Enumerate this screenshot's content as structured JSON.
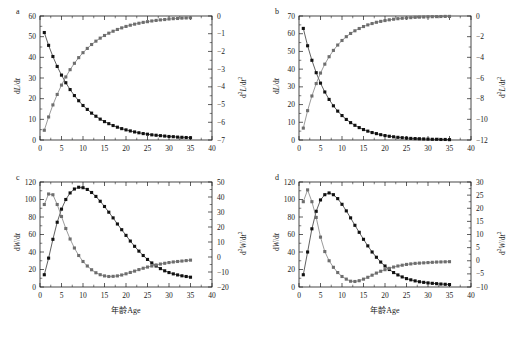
{
  "figure": {
    "width": 518,
    "height": 339,
    "background": "#ffffff",
    "panel_letters": [
      "a",
      "b",
      "c",
      "d"
    ]
  },
  "colors": {
    "series_first": "#111111",
    "series_second": "#6e6e6e",
    "axis": "#1a1a1a",
    "background": "#ffffff"
  },
  "labels": {
    "xlabel_cn": "年龄",
    "xlabel_en": "Age",
    "xlabel_full": "年龄Age",
    "dL_dt": "dL/dt",
    "d2L_dt2": "d²L/dt²",
    "dW_dt": "dW/dt",
    "d2W_dt2": "d²W/dt²"
  },
  "chart_data": [
    {
      "id": "panel-a",
      "panel": "a",
      "type": "line",
      "title": "",
      "xlabel": "",
      "ylabel": "dL/dt",
      "y2label": "d²L/dt²",
      "xlim": [
        0,
        40
      ],
      "ylim": [
        0,
        60
      ],
      "y2lim": [
        -7,
        0
      ],
      "xticks": [
        0,
        5,
        10,
        15,
        20,
        25,
        30,
        35,
        40
      ],
      "yticks": [
        0,
        10,
        20,
        30,
        40,
        50,
        60
      ],
      "y2ticks": [
        -7,
        -6,
        -5,
        -4,
        -3,
        -2,
        -1,
        0
      ],
      "grid": false,
      "legend": "none",
      "x": [
        1,
        2,
        3,
        4,
        5,
        6,
        7,
        8,
        9,
        10,
        11,
        12,
        13,
        14,
        15,
        16,
        17,
        18,
        19,
        20,
        21,
        22,
        23,
        24,
        25,
        26,
        27,
        28,
        29,
        30,
        31,
        32,
        33,
        34,
        35
      ],
      "series": [
        {
          "name": "dL/dt",
          "axis": "left",
          "marker": "square-filled",
          "color": "#111111",
          "values": [
            52.0,
            45.8,
            40.4,
            35.6,
            31.4,
            27.7,
            24.4,
            21.5,
            19.0,
            16.7,
            14.8,
            13.0,
            11.5,
            10.1,
            8.9,
            7.9,
            7.0,
            6.2,
            5.5,
            4.9,
            4.4,
            3.9,
            3.5,
            3.1,
            2.8,
            2.5,
            2.3,
            2.1,
            1.9,
            1.7,
            1.6,
            1.4,
            1.3,
            1.2,
            1.1
          ]
        },
        {
          "name": "d²L/dt²",
          "axis": "right",
          "marker": "square-filled",
          "color": "#6e6e6e",
          "values": [
            -6.45,
            -5.7,
            -5.02,
            -4.43,
            -3.9,
            -3.44,
            -3.03,
            -2.67,
            -2.35,
            -2.07,
            -1.83,
            -1.61,
            -1.42,
            -1.25,
            -1.1,
            -0.97,
            -0.86,
            -0.76,
            -0.67,
            -0.59,
            -0.52,
            -0.46,
            -0.41,
            -0.36,
            -0.32,
            -0.28,
            -0.25,
            -0.22,
            -0.2,
            -0.17,
            -0.15,
            -0.14,
            -0.12,
            -0.11,
            -0.1
          ]
        }
      ]
    },
    {
      "id": "panel-b",
      "panel": "b",
      "type": "line",
      "title": "",
      "xlabel": "",
      "ylabel": "dL/dt",
      "y2label": "d²L/dt²",
      "xlim": [
        0,
        40
      ],
      "ylim": [
        0,
        70
      ],
      "y2lim": [
        -12,
        0
      ],
      "xticks": [
        0,
        5,
        10,
        15,
        20,
        25,
        30,
        35,
        40
      ],
      "yticks": [
        0,
        10,
        20,
        30,
        40,
        50,
        60,
        70
      ],
      "y2ticks": [
        -12,
        -10,
        -8,
        -6,
        -4,
        -2,
        0
      ],
      "grid": false,
      "legend": "none",
      "x": [
        1,
        2,
        3,
        4,
        5,
        6,
        7,
        8,
        9,
        10,
        11,
        12,
        13,
        14,
        15,
        16,
        17,
        18,
        19,
        20,
        21,
        22,
        23,
        24,
        25,
        26,
        27,
        28,
        29,
        30,
        31,
        32,
        33,
        34,
        35
      ],
      "series": [
        {
          "name": "dL/dt",
          "axis": "left",
          "marker": "square-filled",
          "color": "#111111",
          "values": [
            63.0,
            53.2,
            45.0,
            38.0,
            32.1,
            27.1,
            22.9,
            19.3,
            16.3,
            13.8,
            11.6,
            9.8,
            8.3,
            7.0,
            5.9,
            5.0,
            4.2,
            3.6,
            3.0,
            2.5,
            2.1,
            1.8,
            1.5,
            1.3,
            1.1,
            0.9,
            0.8,
            0.7,
            0.6,
            0.5,
            0.4,
            0.4,
            0.3,
            0.3,
            0.2
          ]
        },
        {
          "name": "d²L/dt²",
          "axis": "right",
          "marker": "square-filled",
          "color": "#6e6e6e",
          "values": [
            -10.85,
            -9.16,
            -7.74,
            -6.54,
            -5.52,
            -4.66,
            -3.94,
            -3.33,
            -2.81,
            -2.37,
            -2.0,
            -1.69,
            -1.43,
            -1.21,
            -1.02,
            -0.86,
            -0.73,
            -0.61,
            -0.52,
            -0.44,
            -0.37,
            -0.31,
            -0.26,
            -0.22,
            -0.19,
            -0.16,
            -0.13,
            -0.11,
            -0.1,
            -0.08,
            -0.07,
            -0.06,
            -0.05,
            -0.04,
            -0.04
          ]
        }
      ]
    },
    {
      "id": "panel-c",
      "panel": "c",
      "type": "line",
      "title": "",
      "xlabel": "年龄Age",
      "ylabel": "dW/dt",
      "y2label": "d²W/dt²",
      "xlim": [
        0,
        40
      ],
      "ylim": [
        0,
        120
      ],
      "y2lim": [
        -20,
        50
      ],
      "xticks": [
        0,
        5,
        10,
        15,
        20,
        25,
        30,
        35,
        40
      ],
      "yticks": [
        0,
        20,
        40,
        60,
        80,
        100,
        120
      ],
      "y2ticks": [
        -20,
        -10,
        0,
        10,
        20,
        30,
        40,
        50
      ],
      "grid": false,
      "legend": "none",
      "x": [
        1,
        2,
        3,
        4,
        5,
        6,
        7,
        8,
        9,
        10,
        11,
        12,
        13,
        14,
        15,
        16,
        17,
        18,
        19,
        20,
        21,
        22,
        23,
        24,
        25,
        26,
        27,
        28,
        29,
        30,
        31,
        32,
        33,
        34,
        35
      ],
      "series": [
        {
          "name": "dW/dt",
          "axis": "left",
          "marker": "square-filled",
          "color": "#111111",
          "values": [
            14.0,
            33.0,
            54.5,
            74.0,
            89.0,
            100.0,
            107.5,
            112.0,
            114.0,
            113.5,
            111.5,
            108.0,
            103.5,
            98.0,
            92.0,
            85.5,
            79.0,
            72.0,
            65.5,
            59.0,
            52.5,
            46.5,
            41.0,
            36.0,
            31.5,
            27.5,
            24.0,
            21.0,
            18.5,
            16.5,
            15.0,
            13.8,
            12.8,
            12.0,
            11.2
          ]
        },
        {
          "name": "d²W/dt²",
          "axis": "right",
          "marker": "square-filled",
          "color": "#6e6e6e",
          "values": [
            35.0,
            42.0,
            41.5,
            35.0,
            27.0,
            19.0,
            12.0,
            6.0,
            1.0,
            -3.0,
            -6.0,
            -8.5,
            -10.5,
            -11.8,
            -12.6,
            -13.0,
            -12.9,
            -12.6,
            -12.0,
            -11.2,
            -10.3,
            -9.4,
            -8.4,
            -7.5,
            -6.7,
            -6.0,
            -5.3,
            -4.7,
            -4.2,
            -3.7,
            -3.3,
            -3.0,
            -2.7,
            -2.4,
            -2.1
          ]
        }
      ]
    },
    {
      "id": "panel-d",
      "panel": "d",
      "type": "line",
      "title": "",
      "xlabel": "年龄Age",
      "ylabel": "dW/dt",
      "y2label": "d²W/dt²",
      "xlim": [
        0,
        40
      ],
      "ylim": [
        0,
        120
      ],
      "y2lim": [
        -10,
        30
      ],
      "xticks": [
        0,
        5,
        10,
        15,
        20,
        25,
        30,
        35,
        40
      ],
      "yticks": [
        0,
        20,
        40,
        60,
        80,
        100,
        120
      ],
      "y2ticks": [
        -10,
        -5,
        0,
        5,
        10,
        15,
        20,
        25,
        30
      ],
      "grid": false,
      "legend": "none",
      "x": [
        1,
        2,
        3,
        4,
        5,
        6,
        7,
        8,
        9,
        10,
        11,
        12,
        13,
        14,
        15,
        16,
        17,
        18,
        19,
        20,
        21,
        22,
        23,
        24,
        25,
        26,
        27,
        28,
        29,
        30,
        31,
        32,
        33,
        34,
        35
      ],
      "series": [
        {
          "name": "dW/dt",
          "axis": "left",
          "marker": "square-filled",
          "color": "#111111",
          "values": [
            14.0,
            40.0,
            66.5,
            86.5,
            99.5,
            105.5,
            107.5,
            105.5,
            101.0,
            94.5,
            87.0,
            79.0,
            70.5,
            62.5,
            54.5,
            47.0,
            40.0,
            34.0,
            28.5,
            24.0,
            20.0,
            16.5,
            13.8,
            11.5,
            9.6,
            8.2,
            7.0,
            6.0,
            5.3,
            4.7,
            4.2,
            3.8,
            3.4,
            3.1,
            2.8
          ]
        },
        {
          "name": "d²W/dt²",
          "axis": "right",
          "marker": "square-filled",
          "color": "#6e6e6e",
          "values": [
            22.5,
            27.0,
            22.5,
            16.5,
            9.0,
            3.5,
            0.0,
            -2.5,
            -4.5,
            -6.0,
            -7.0,
            -7.8,
            -7.9,
            -7.6,
            -7.0,
            -6.3,
            -5.5,
            -4.7,
            -4.0,
            -3.4,
            -2.9,
            -2.4,
            -2.0,
            -1.7,
            -1.4,
            -1.2,
            -1.0,
            -0.9,
            -0.8,
            -0.7,
            -0.6,
            -0.5,
            -0.45,
            -0.4,
            -0.35
          ]
        }
      ]
    }
  ]
}
